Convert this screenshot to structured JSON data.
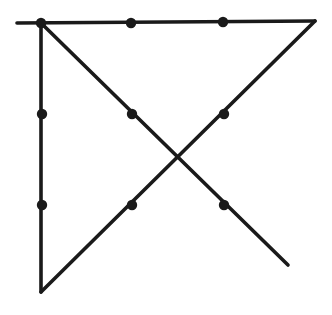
{
  "diagram": {
    "title": "",
    "type": "nine-dots-puzzle-solution",
    "colors": {
      "ink": "#1a1a1a",
      "background": "#ffffff"
    },
    "dots": [
      {
        "id": "r1c1",
        "x": 41,
        "y": 23
      },
      {
        "id": "r1c2",
        "x": 131,
        "y": 23
      },
      {
        "id": "r1c3",
        "x": 223,
        "y": 22
      },
      {
        "id": "r2c1",
        "x": 42,
        "y": 114
      },
      {
        "id": "r2c2",
        "x": 132,
        "y": 114
      },
      {
        "id": "r2c3",
        "x": 224,
        "y": 114
      },
      {
        "id": "r3c1",
        "x": 42,
        "y": 205
      },
      {
        "id": "r3c2",
        "x": 132,
        "y": 205
      },
      {
        "id": "r3c3",
        "x": 224,
        "y": 205
      }
    ],
    "lines": [
      {
        "id": "top-horizontal",
        "x1": 17,
        "y1": 23,
        "x2": 315,
        "y2": 21
      },
      {
        "id": "diagonal-return",
        "x1": 315,
        "y1": 21,
        "x2": 41,
        "y2": 292
      },
      {
        "id": "left-vertical",
        "x1": 41,
        "y1": 292,
        "x2": 41,
        "y2": 23
      },
      {
        "id": "main-diagonal",
        "x1": 41,
        "y1": 23,
        "x2": 288,
        "y2": 265
      }
    ]
  }
}
